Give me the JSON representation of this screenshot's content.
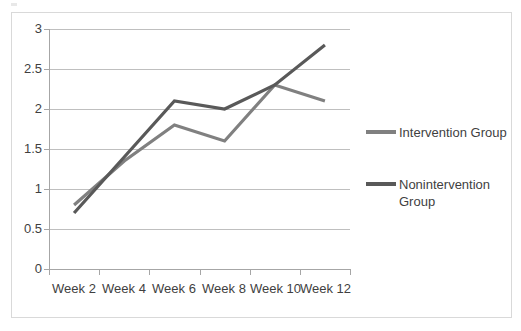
{
  "chart_data": {
    "type": "line",
    "title": "",
    "xlabel": "",
    "ylabel": "",
    "categories": [
      "Week 2",
      "Week 4",
      "Week 6",
      "Week 8",
      "Week 10",
      "Week 12"
    ],
    "ylim": [
      0,
      3
    ],
    "yticks": [
      "0",
      "0.5",
      "1",
      "1.5",
      "2",
      "2.5",
      "3"
    ],
    "ytick_values": [
      0,
      0.5,
      1,
      1.5,
      2,
      2.5,
      3
    ],
    "grid": true,
    "legend_position": "right",
    "series": [
      {
        "name": "Intervention Group",
        "color": "#808080",
        "values": [
          0.8,
          1.35,
          1.8,
          1.6,
          2.3,
          2.1
        ]
      },
      {
        "name": "Nonintervention Group",
        "color": "#595959",
        "values": [
          0.7,
          1.4,
          2.1,
          2.0,
          2.3,
          2.8
        ]
      }
    ]
  },
  "legend": {
    "entries": [
      {
        "label": "Intervention Group",
        "color": "#808080"
      },
      {
        "label": "Nonintervention Group",
        "color": "#595959"
      }
    ]
  },
  "colors": {
    "intervention": "#808080",
    "nonintervention": "#595959",
    "gridline": "#bfbfbf",
    "axis": "#a6a6a6",
    "frame": "#d9d9d9",
    "text": "#3f3f3f",
    "background": "#ffffff"
  }
}
